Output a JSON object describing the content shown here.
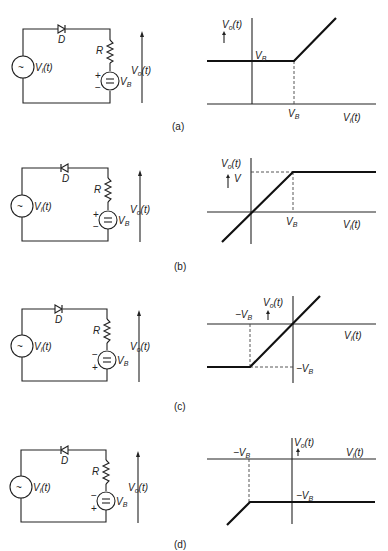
{
  "figure": {
    "panels": [
      {
        "id": "a",
        "caption": "(a)",
        "circuit": {
          "diode_label": "D",
          "diode_direction": "right",
          "resistor_label": "R",
          "source_label": "V",
          "source_sub": "i",
          "source_suffix": "(t)",
          "battery_label": "V",
          "battery_sub": "B",
          "battery_top_sign": "+",
          "battery_bottom_sign": "−",
          "output_label": "V",
          "output_sub": "o",
          "output_suffix": "(t)"
        },
        "graph": {
          "y_axis_label": "V",
          "y_axis_sub": "o",
          "y_axis_suffix": "(t)",
          "x_axis_label": "V",
          "x_axis_sub": "i",
          "x_axis_suffix": "(t)",
          "level_label": "V",
          "level_sub": "B",
          "break_label": "V",
          "break_sub": "B"
        }
      },
      {
        "id": "b",
        "caption": "(b)",
        "circuit": {
          "diode_label": "D",
          "diode_direction": "left",
          "resistor_label": "R",
          "source_label": "V",
          "source_sub": "i",
          "source_suffix": "(t)",
          "battery_label": "V",
          "battery_sub": "B",
          "battery_top_sign": "+",
          "battery_bottom_sign": "−",
          "output_label": "V",
          "output_sub": "o",
          "output_suffix": "(t)"
        },
        "graph": {
          "y_axis_label": "V",
          "y_axis_sub": "o",
          "y_axis_suffix": "(t)",
          "y_extra": "V",
          "x_axis_label": "V",
          "x_axis_sub": "i",
          "x_axis_suffix": "(t)",
          "break_label": "V",
          "break_sub": "B"
        }
      },
      {
        "id": "c",
        "caption": "(c)",
        "circuit": {
          "diode_label": "D",
          "diode_direction": "right",
          "resistor_label": "R",
          "source_label": "V",
          "source_sub": "i",
          "source_suffix": "(t)",
          "battery_label": "V",
          "battery_sub": "B",
          "battery_top_sign": "−",
          "battery_bottom_sign": "+",
          "output_label": "V",
          "output_sub": "o",
          "output_suffix": "(t)"
        },
        "graph": {
          "y_axis_label": "V",
          "y_axis_sub": "o",
          "y_axis_suffix": "(t)",
          "x_axis_label": "V",
          "x_axis_sub": "i",
          "x_axis_suffix": "(t)",
          "break_label": "−V",
          "break_sub": "B",
          "level_label": "−V",
          "level_sub": "B"
        }
      },
      {
        "id": "d",
        "caption": "(d)",
        "circuit": {
          "diode_label": "D",
          "diode_direction": "left",
          "resistor_label": "R",
          "source_label": "V",
          "source_sub": "i",
          "source_suffix": "(t)",
          "battery_label": "V",
          "battery_sub": "B",
          "battery_top_sign": "−",
          "battery_bottom_sign": "+",
          "output_label": "V",
          "output_sub": "o",
          "output_suffix": "(t)"
        },
        "graph": {
          "y_axis_label": "V",
          "y_axis_sub": "o",
          "y_axis_suffix": "(t)",
          "x_axis_label": "V",
          "x_axis_sub": "i",
          "x_axis_suffix": "(t)",
          "break_label": "−V",
          "break_sub": "B",
          "level_label": "−V",
          "level_sub": "B"
        }
      }
    ],
    "source_symbol": "~",
    "battery_symbol": "="
  }
}
